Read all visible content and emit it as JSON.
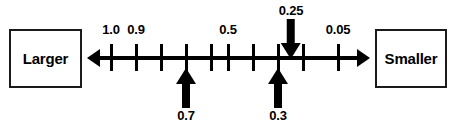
{
  "diagram": {
    "left_box_label": "Larger",
    "right_box_label": "Smaller",
    "left_arrow_icon": "arrow-left-icon",
    "right_arrow_icon": "arrow-right-icon"
  },
  "chart_data": {
    "type": "line",
    "title": "",
    "subtitle": "",
    "xlabel": "",
    "ylabel": "",
    "orientation": "horizontal",
    "grid": false,
    "legend": "none",
    "axis_direction_labels": {
      "left": "Larger",
      "right": "Smaller"
    },
    "axis_endpoint_arrows": [
      "left",
      "right"
    ],
    "tick_count": 10,
    "tick_positions_px": [
      111,
      136,
      161,
      186,
      211,
      228,
      253,
      278,
      303,
      338
    ],
    "tick_labels": [
      {
        "value": "1.0",
        "x_px": 111
      },
      {
        "value": "0.9",
        "x_px": 136
      },
      {
        "value": "0.5",
        "x_px": 228
      },
      {
        "value": "0.05",
        "x_px": 338
      }
    ],
    "markers": [
      {
        "value": "0.25",
        "x_px": 291,
        "direction": "down"
      },
      {
        "value": "0.7",
        "x_px": 186,
        "direction": "up"
      },
      {
        "value": "0.3",
        "x_px": 278,
        "direction": "up"
      }
    ],
    "colors": {
      "foreground": "#000000",
      "background": "#ffffff",
      "box_border": "#1a1a1a"
    }
  }
}
